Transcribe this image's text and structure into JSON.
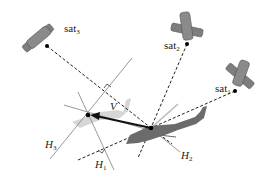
{
  "diagram": {
    "satellites": [
      {
        "id": "sat1",
        "label": "sat",
        "subscript": "1"
      },
      {
        "id": "sat2",
        "label": "sat",
        "subscript": "2"
      },
      {
        "id": "sat3",
        "label": "sat",
        "subscript": "3"
      }
    ],
    "lines": [
      {
        "id": "H1",
        "label": "H",
        "subscript": "1"
      },
      {
        "id": "H2",
        "label": "H",
        "subscript": "2"
      },
      {
        "id": "H3",
        "label": "H",
        "subscript": "3"
      }
    ],
    "vector": {
      "label": "V"
    },
    "colors": {
      "satellite": "#7a7a7a",
      "helicopter": "#6e6e6e",
      "ghost_helicopter": "#d4d4d4",
      "line": "#8a8a8a",
      "dashed": "#222222"
    }
  }
}
